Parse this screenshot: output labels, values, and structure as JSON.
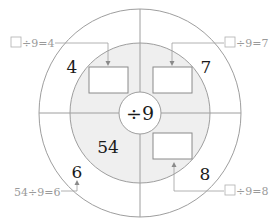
{
  "center_operator": "÷9",
  "outer_ring_numbers": {
    "top_left": "4",
    "top_right": "7",
    "bottom_left": "6",
    "bottom_right": "8"
  },
  "inner_ring_numbers": {
    "bottom_left": "54"
  },
  "callouts": {
    "top_left": "÷9=4",
    "top_right": "÷9=7",
    "bottom_left": "54÷9=6",
    "bottom_right": "÷9=8"
  },
  "colors": {
    "line": "#9e9e9e",
    "inner_fill": "#efefef",
    "callout_text": "#9a9a9a",
    "number_text": "#1a1a1a"
  }
}
